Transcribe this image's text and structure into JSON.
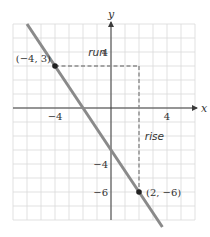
{
  "chart_data": {
    "type": "line",
    "title": "",
    "xlabel": "x",
    "ylabel": "y",
    "xlim": [
      -7,
      6
    ],
    "ylim": [
      -8,
      6
    ],
    "grid": true,
    "x_ticks": [
      {
        "value": -4,
        "label": "−4"
      },
      {
        "value": 4,
        "label": "4"
      }
    ],
    "y_ticks": [
      {
        "value": 4,
        "label": "4"
      },
      {
        "value": -4,
        "label": "−4"
      },
      {
        "value": -6,
        "label": "−6"
      }
    ],
    "series": [
      {
        "name": "line",
        "equation": "y = -1.5x - 3",
        "slope": -1.5,
        "intercept": -3,
        "x": [
          -6,
          3.67
        ],
        "y": [
          6,
          -8.5
        ],
        "color": "#8a8a8a"
      }
    ],
    "points": [
      {
        "x": -4,
        "y": 3,
        "label": "(−4,  3)",
        "label_side": "left"
      },
      {
        "x": 2,
        "y": -6,
        "label": "(2,  −6)",
        "label_side": "right"
      }
    ],
    "annotations": [
      {
        "text": "run",
        "type": "horizontal-dashed",
        "from": [
          -4,
          3
        ],
        "to": [
          2,
          3
        ],
        "label_at": [
          -1,
          3.7
        ]
      },
      {
        "text": "rise",
        "type": "vertical-dashed",
        "from": [
          2,
          3
        ],
        "to": [
          2,
          -6
        ],
        "label_at": [
          3.1,
          -2.3
        ]
      }
    ]
  }
}
